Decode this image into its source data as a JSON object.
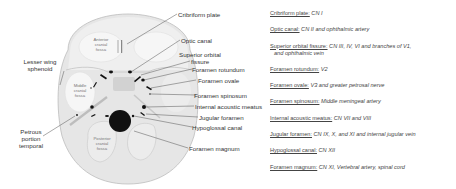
{
  "diagram": {
    "labels": {
      "cribriform_plate": "Cribriform plate",
      "optic_canal": "Optic canal",
      "superior_orbital_fissure_1": "Superior orbital",
      "superior_orbital_fissure_2": "fissure",
      "foramen_rotundum": "Foramen rotundum",
      "foramen_ovale": "Foramen ovale",
      "foramen_spinosum": "Foramen spinosum",
      "internal_acoustic_meatus": "Internal acoustic meatus",
      "jugular_foramen": "Jugular foramen",
      "hypoglossal_canal": "Hypoglossal canal",
      "foramen_magnum": "Foramen magnum",
      "lesser_wing_1": "Lesser wing",
      "lesser_wing_2": "sphenoid",
      "petrous_1": "Petrous",
      "petrous_2": "portion",
      "petrous_3": "temporal"
    },
    "fossae": {
      "anterior": [
        "Anterior",
        "cranial",
        "fossa"
      ],
      "middle": [
        "Middle",
        "cranial",
        "fossa"
      ],
      "posterior": [
        "Posterior",
        "cranial",
        "fossa"
      ]
    },
    "colors": {
      "skull_fill": "#e6e6e6",
      "fossa_fill": "#f4f4f4",
      "outline": "#bdbdbd",
      "foramen": "#111111",
      "leader": "#555555"
    }
  },
  "legend": [
    {
      "name": "Cribriform plate:",
      "contents": "CN I"
    },
    {
      "name": "Optic canal:",
      "contents": "CN II and ophthalmic artery"
    },
    {
      "name": "Superior orbital fissure:",
      "contents": "CN III, IV, VI and branches of V1,",
      "contents_line2": "and ophthalmic vein"
    },
    {
      "name": "Foramen rotundum:",
      "contents": "V2"
    },
    {
      "name": "Foramen ovale:",
      "contents": "V3 and greater petrosal nerve"
    },
    {
      "name": "Foramen spinosum:",
      "contents": "Middle meningeal artery"
    },
    {
      "name": "Internal acoustic meatus:",
      "contents": "CN VII and VIII"
    },
    {
      "name": "Jugular foramen:",
      "contents": "CN IX, X, and XI and internal jugular vein"
    },
    {
      "name": "Hypoglossal canal:",
      "contents": "CN XII"
    },
    {
      "name": "Foramen magnum:",
      "contents": "CN XI, Vertebral artery, spinal cord"
    }
  ]
}
